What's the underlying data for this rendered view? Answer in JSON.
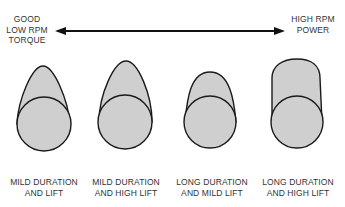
{
  "arrow": {
    "left_label": [
      "GOOD",
      "LOW RPM",
      "TORQUE"
    ],
    "right_label": [
      "HIGH RPM",
      "POWER"
    ]
  },
  "lobes": [
    {
      "label": [
        "MILD DURATION",
        "AND LIFT"
      ],
      "shape": "narrow-pointed-mild"
    },
    {
      "label": [
        "MILD DURATION",
        "AND HIGH LIFT"
      ],
      "shape": "narrow-pointed-high"
    },
    {
      "label": [
        "LONG DURATION",
        "AND MILD LIFT"
      ],
      "shape": "wide-rounded-mild"
    },
    {
      "label": [
        "LONG DURATION",
        "AND HIGH LIFT"
      ],
      "shape": "wide-rounded-high"
    }
  ],
  "colors": {
    "fill": "#cfcfcf",
    "stroke": "#1a1a1a",
    "text": "#333333"
  }
}
